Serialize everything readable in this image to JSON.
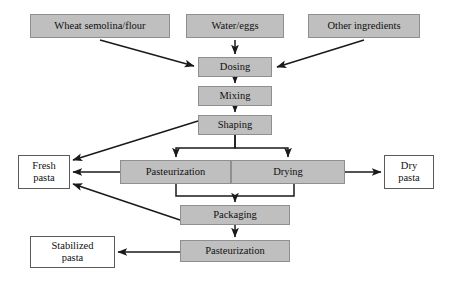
{
  "diagram": {
    "colors": {
      "process_fill": "#bfbfbf",
      "process_border": "#8f8f8f",
      "output_fill": "#ffffff",
      "output_border": "#5a5a5a",
      "edge": "#1a1a1a",
      "background": "#ffffff"
    },
    "nodes": [
      {
        "id": "wheat",
        "label": "Wheat semolina/flour",
        "kind": "ingredient",
        "x": 30,
        "y": 14,
        "w": 140,
        "h": 24
      },
      {
        "id": "water",
        "label": "Water/eggs",
        "kind": "ingredient",
        "x": 186,
        "y": 14,
        "w": 98,
        "h": 24
      },
      {
        "id": "other",
        "label": "Other ingredients",
        "kind": "ingredient",
        "x": 308,
        "y": 14,
        "w": 112,
        "h": 24
      },
      {
        "id": "dosing",
        "label": "Dosing",
        "kind": "process",
        "x": 198,
        "y": 57,
        "w": 74,
        "h": 20
      },
      {
        "id": "mixing",
        "label": "Mixing",
        "kind": "process",
        "x": 198,
        "y": 86,
        "w": 74,
        "h": 20
      },
      {
        "id": "shaping",
        "label": "Shaping",
        "kind": "process",
        "x": 198,
        "y": 115,
        "w": 74,
        "h": 20
      },
      {
        "id": "pasteurization1",
        "label": "Pasteurization",
        "kind": "process",
        "x": 120,
        "y": 160,
        "w": 111,
        "h": 24
      },
      {
        "id": "drying",
        "label": "Drying",
        "kind": "process",
        "x": 231,
        "y": 160,
        "w": 114,
        "h": 24
      },
      {
        "id": "fresh",
        "label": "Fresh\npasta",
        "kind": "output",
        "x": 18,
        "y": 155,
        "w": 52,
        "h": 34
      },
      {
        "id": "dry",
        "label": "Dry\npasta",
        "kind": "output",
        "x": 384,
        "y": 155,
        "w": 50,
        "h": 34
      },
      {
        "id": "packaging",
        "label": "Packaging",
        "kind": "process",
        "x": 180,
        "y": 205,
        "w": 110,
        "h": 20
      },
      {
        "id": "pasteurization2",
        "label": "Pasteurization",
        "kind": "process",
        "x": 180,
        "y": 240,
        "w": 110,
        "h": 22
      },
      {
        "id": "stabilized",
        "label": "Stabilized\npasta",
        "kind": "output",
        "x": 30,
        "y": 236,
        "w": 85,
        "h": 32
      }
    ],
    "edges": [
      {
        "from": "wheat",
        "to": "dosing",
        "style": "diagonal"
      },
      {
        "from": "water",
        "to": "dosing",
        "style": "vertical"
      },
      {
        "from": "other",
        "to": "dosing",
        "style": "diagonal"
      },
      {
        "from": "dosing",
        "to": "mixing",
        "style": "vertical"
      },
      {
        "from": "mixing",
        "to": "shaping",
        "style": "vertical"
      },
      {
        "from": "shaping",
        "to": "fresh",
        "style": "diagonal"
      },
      {
        "from": "shaping",
        "to": "pasteurization1",
        "style": "elbow-split"
      },
      {
        "from": "shaping",
        "to": "drying",
        "style": "elbow-split"
      },
      {
        "from": "pasteurization1",
        "to": "fresh",
        "style": "horizontal"
      },
      {
        "from": "drying",
        "to": "dry",
        "style": "horizontal"
      },
      {
        "from": "pasteurization1",
        "to": "packaging",
        "style": "elbow-merge"
      },
      {
        "from": "drying",
        "to": "packaging",
        "style": "elbow-merge"
      },
      {
        "from": "packaging",
        "to": "fresh",
        "style": "diagonal"
      },
      {
        "from": "packaging",
        "to": "pasteurization2",
        "style": "vertical"
      },
      {
        "from": "pasteurization2",
        "to": "stabilized",
        "style": "horizontal"
      }
    ]
  }
}
